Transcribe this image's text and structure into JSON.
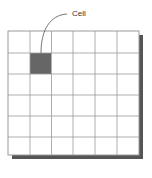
{
  "diagram": {
    "rows": 6,
    "cols": 6,
    "highlighted_cell": {
      "row": 1,
      "col": 1
    },
    "callout_label": "Cell",
    "colors": {
      "grid_line": "#9a9a9a",
      "cell_fill": "#666666",
      "shadow": "#555555",
      "background": "#ffffff"
    }
  }
}
